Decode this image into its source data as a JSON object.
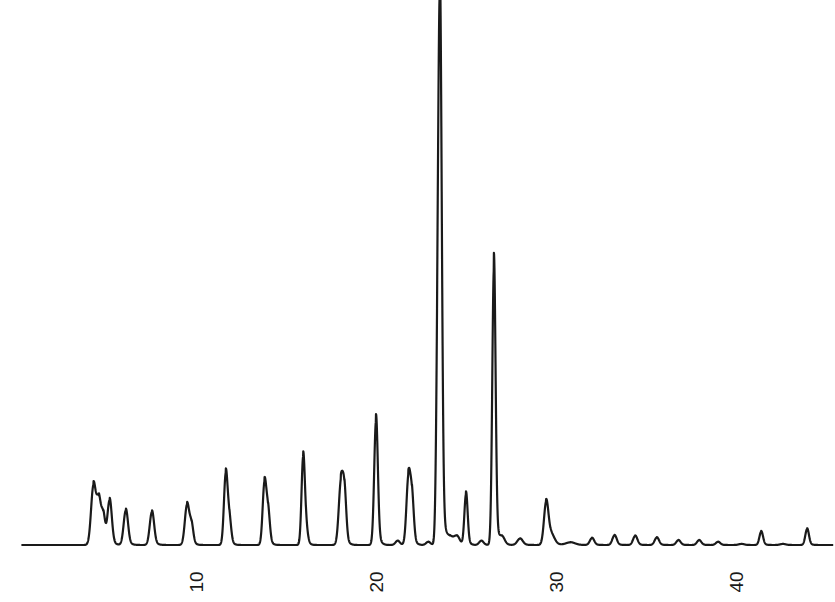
{
  "chart_data": {
    "type": "line",
    "title": "",
    "xlabel": "",
    "ylabel": "",
    "x_ticks": [
      10,
      20,
      30,
      40
    ],
    "x_tick_labels": [
      "10",
      "20",
      "30",
      "40"
    ],
    "xlim": [
      0,
      45.5
    ],
    "ylim": [
      0,
      100
    ],
    "grid": false,
    "legend": null,
    "y_units": "relative response (% of largest peak)",
    "peaks": [
      {
        "t": 4.3,
        "h": 11.0,
        "w": 0.13
      },
      {
        "t": 4.6,
        "h": 8.0,
        "w": 0.12
      },
      {
        "t": 4.85,
        "h": 5.0,
        "w": 0.1
      },
      {
        "t": 5.2,
        "h": 8.3,
        "w": 0.12
      },
      {
        "t": 6.1,
        "h": 6.5,
        "w": 0.12
      },
      {
        "t": 7.55,
        "h": 6.2,
        "w": 0.12
      },
      {
        "t": 9.5,
        "h": 7.5,
        "w": 0.12
      },
      {
        "t": 9.75,
        "h": 3.5,
        "w": 0.1
      },
      {
        "t": 11.65,
        "h": 13.0,
        "w": 0.1
      },
      {
        "t": 11.85,
        "h": 4.5,
        "w": 0.1
      },
      {
        "t": 13.8,
        "h": 11.2,
        "w": 0.1
      },
      {
        "t": 14.0,
        "h": 6.0,
        "w": 0.1
      },
      {
        "t": 15.95,
        "h": 15.7,
        "w": 0.09
      },
      {
        "t": 16.1,
        "h": 3.0,
        "w": 0.1
      },
      {
        "t": 18.05,
        "h": 11.5,
        "w": 0.12
      },
      {
        "t": 18.25,
        "h": 8.5,
        "w": 0.1
      },
      {
        "t": 20.0,
        "h": 23.3,
        "w": 0.1
      },
      {
        "t": 21.2,
        "h": 0.8,
        "w": 0.12
      },
      {
        "t": 21.8,
        "h": 12.4,
        "w": 0.11
      },
      {
        "t": 22.0,
        "h": 8.0,
        "w": 0.1
      },
      {
        "t": 22.9,
        "h": 0.6,
        "w": 0.12
      },
      {
        "t": 23.55,
        "h": 100.0,
        "w": 0.1
      },
      {
        "t": 23.4,
        "h": 16.5,
        "w": 0.08
      },
      {
        "t": 24.1,
        "h": 1.5,
        "w": 0.2
      },
      {
        "t": 24.5,
        "h": 1.5,
        "w": 0.15
      },
      {
        "t": 25.0,
        "h": 9.5,
        "w": 0.09
      },
      {
        "t": 25.85,
        "h": 0.8,
        "w": 0.12
      },
      {
        "t": 26.55,
        "h": 52.0,
        "w": 0.09
      },
      {
        "t": 27.0,
        "h": 1.5,
        "w": 0.15
      },
      {
        "t": 28.0,
        "h": 1.2,
        "w": 0.15
      },
      {
        "t": 29.45,
        "h": 7.3,
        "w": 0.12
      },
      {
        "t": 29.7,
        "h": 2.0,
        "w": 0.2
      },
      {
        "t": 30.8,
        "h": 0.5,
        "w": 0.25
      },
      {
        "t": 32.0,
        "h": 1.3,
        "w": 0.12
      },
      {
        "t": 33.25,
        "h": 1.8,
        "w": 0.12
      },
      {
        "t": 34.4,
        "h": 1.7,
        "w": 0.12
      },
      {
        "t": 35.6,
        "h": 1.4,
        "w": 0.12
      },
      {
        "t": 36.8,
        "h": 0.9,
        "w": 0.12
      },
      {
        "t": 37.95,
        "h": 0.9,
        "w": 0.12
      },
      {
        "t": 39.0,
        "h": 0.6,
        "w": 0.12
      },
      {
        "t": 40.3,
        "h": 0.2,
        "w": 0.15
      },
      {
        "t": 41.4,
        "h": 2.5,
        "w": 0.1
      },
      {
        "t": 42.6,
        "h": 0.2,
        "w": 0.15
      },
      {
        "t": 43.95,
        "h": 3.0,
        "w": 0.1
      }
    ],
    "baseline_start": 0.3,
    "baseline_end": 45.4
  },
  "layout": {
    "x_origin_px": 16,
    "px_per_unit": 18,
    "baseline_px": 545,
    "full_scale_px": 530,
    "trace_color": "#1a1a1a",
    "label_y_px": 582
  }
}
